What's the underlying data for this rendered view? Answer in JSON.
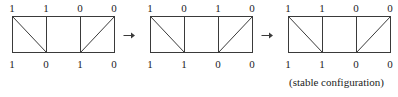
{
  "figure": {
    "type": "diagram-sequence",
    "background_color": "#ffffff",
    "line_color": "#3a3a3a",
    "text_color": "#1c1c1c",
    "arrow_glyph": "right-arrow",
    "arrows": [
      {
        "name": "arrow-1",
        "glyph": "→"
      },
      {
        "name": "arrow-2",
        "glyph": "→"
      }
    ],
    "diagrams": [
      {
        "name": "configuration-1",
        "top_labels": [
          "1",
          "1",
          "0",
          "0"
        ],
        "bottom_labels": [
          "1",
          "0",
          "1",
          "0"
        ],
        "cells": [
          {
            "index": 0,
            "diagonal": "tl-br"
          },
          {
            "index": 1,
            "diagonal": "none"
          },
          {
            "index": 2,
            "diagonal": "bl-tr"
          }
        ],
        "caption": ""
      },
      {
        "name": "configuration-2",
        "top_labels": [
          "1",
          "0",
          "1",
          "0"
        ],
        "bottom_labels": [
          "1",
          "1",
          "0",
          "0"
        ],
        "cells": [
          {
            "index": 0,
            "diagonal": "tl-br"
          },
          {
            "index": 1,
            "diagonal": "none"
          },
          {
            "index": 2,
            "diagonal": "bl-tr"
          }
        ],
        "caption": ""
      },
      {
        "name": "configuration-3",
        "top_labels": [
          "1",
          "1",
          "0",
          "0"
        ],
        "bottom_labels": [
          "1",
          "1",
          "0",
          "0"
        ],
        "cells": [
          {
            "index": 0,
            "diagonal": "tl-br"
          },
          {
            "index": 1,
            "diagonal": "none"
          },
          {
            "index": 2,
            "diagonal": "bl-tr"
          }
        ],
        "caption": "(stable configuration)"
      }
    ]
  }
}
